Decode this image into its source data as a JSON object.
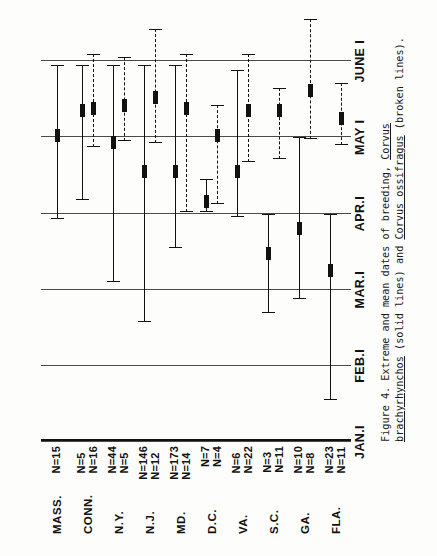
{
  "figure": {
    "caption_prefix": "Figure 4. Extreme and mean dates of breeding, ",
    "species_solid": "Corvus brachyrhynchos",
    "caption_mid": " (solid lines) and ",
    "species_dashed": "Corvus ossifragus",
    "caption_suffix": " (broken lines)."
  },
  "chart_data": {
    "type": "bar",
    "title": "Extreme and mean dates of breeding",
    "xlabel": "",
    "ylabel": "",
    "orientation": "horizontal",
    "grid": true,
    "legend": [
      {
        "name": "Corvus brachyrhynchos",
        "style": "solid line"
      },
      {
        "name": "Corvus ossifragus",
        "style": "broken line"
      }
    ],
    "axis_ticks": [
      "JAN.I",
      "FEB.I",
      "MAR.I",
      "APR.I",
      "MAY I",
      "JUNE I"
    ],
    "axis_tick_positions": [
      0,
      1,
      2,
      3,
      4,
      5
    ],
    "xlim": [
      0,
      5.2
    ],
    "categories": [
      "MASS.",
      "CONN.",
      "N.Y.",
      "N.J.",
      "MD.",
      "D.C.",
      "VA.",
      "S.C.",
      "GA.",
      "FLA."
    ],
    "series": [
      {
        "name": "Corvus brachyrhynchos",
        "style": "solid",
        "n_label_prefix": "N=",
        "points": [
          {
            "category": "MASS.",
            "n": 15,
            "n_text": "N=15",
            "low": 2.93,
            "mean": 4.03,
            "high": 4.95
          },
          {
            "category": "CONN.",
            "n": 5,
            "n_text": "N=5",
            "low": 3.18,
            "mean": 4.35,
            "high": 4.95
          },
          {
            "category": "N.Y.",
            "n": 44,
            "n_text": "N=44",
            "low": 2.1,
            "mean": 3.93,
            "high": 4.95
          },
          {
            "category": "N.J.",
            "n": 146,
            "n_text": "N=146",
            "low": 1.58,
            "mean": 3.55,
            "high": 4.95
          },
          {
            "category": "MD.",
            "n": 173,
            "n_text": "N=173",
            "low": 2.55,
            "mean": 3.55,
            "high": 4.95
          },
          {
            "category": "D.C.",
            "n": 7,
            "n_text": "N=7",
            "low": 3.02,
            "mean": 3.16,
            "high": 3.45
          },
          {
            "category": "VA.",
            "n": 6,
            "n_text": "N=6",
            "low": 2.95,
            "mean": 3.55,
            "high": 4.88
          },
          {
            "category": "S.C.",
            "n": 3,
            "n_text": "N=3",
            "low": 1.7,
            "mean": 2.48,
            "high": 3.0
          },
          {
            "category": "GA.",
            "n": 10,
            "n_text": "N=10",
            "low": 1.88,
            "mean": 2.8,
            "high": 4.0
          },
          {
            "category": "FLA.",
            "n": 23,
            "n_text": "N=23",
            "low": 0.55,
            "mean": 2.25,
            "high": 3.0
          }
        ]
      },
      {
        "name": "Corvus ossifragus",
        "style": "dashed",
        "n_label_prefix": "N=",
        "points": [
          {
            "category": "CONN.",
            "n": 16,
            "n_text": "N=16",
            "low": 3.88,
            "mean": 4.38,
            "high": 5.1
          },
          {
            "category": "N.Y.",
            "n": 5,
            "n_text": "N=5",
            "low": 3.95,
            "mean": 4.42,
            "high": 5.05
          },
          {
            "category": "N.J.",
            "n": 12,
            "n_text": "N=12",
            "low": 3.93,
            "mean": 4.52,
            "high": 5.42
          },
          {
            "category": "MD.",
            "n": 14,
            "n_text": "N=14",
            "low": 3.02,
            "mean": 4.38,
            "high": 5.1
          },
          {
            "category": "D.C.",
            "n": 4,
            "n_text": "N=4",
            "low": 3.12,
            "mean": 4.02,
            "high": 4.43
          },
          {
            "category": "VA.",
            "n": 22,
            "n_text": "N=22",
            "low": 3.68,
            "mean": 4.35,
            "high": 5.1
          },
          {
            "category": "S.C.",
            "n": 11,
            "n_text": "N=11",
            "low": 3.72,
            "mean": 4.35,
            "high": 4.65
          },
          {
            "category": "GA.",
            "n": 8,
            "n_text": "N=8",
            "low": 3.98,
            "mean": 4.62,
            "high": 5.55
          },
          {
            "category": "FLA.",
            "n": 11,
            "n_text": "N=11",
            "low": 3.9,
            "mean": 4.25,
            "high": 4.72
          }
        ]
      }
    ]
  }
}
